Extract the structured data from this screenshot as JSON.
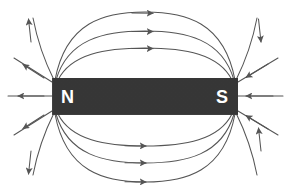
{
  "figure": {
    "background_color": "#ffffff",
    "line_color": "#555555",
    "magnet_color": "#3b3b3b",
    "label_color": "#ffffff"
  },
  "magnet": {
    "name": "bar-magnet",
    "north_label": "N",
    "south_label": "S",
    "x": 52,
    "y": 78,
    "width": 186,
    "height": 37
  },
  "field": {
    "description": "Magnetic field lines emerging from the N pole and entering the S pole",
    "arrow_direction": "N to S outside the magnet",
    "upper_arc_count": 3,
    "lower_arc_count": 3,
    "left_fan_count": 5,
    "right_fan_count": 5,
    "arc_arrow_label": "field-direction-arrow"
  }
}
